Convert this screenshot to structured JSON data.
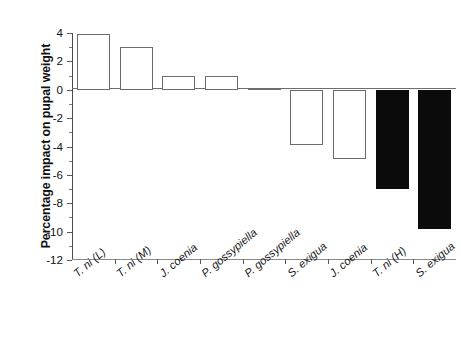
{
  "chart_data": {
    "type": "bar",
    "title": "",
    "xlabel": "",
    "ylabel": "Percentage impact on pupal weight",
    "categories": [
      "T. ni (L)",
      "T. ni (M)",
      "J. coenia",
      "P. gossypiella",
      "P. gossypiella",
      "S. exigua",
      "J. coenia",
      "T. ni (H)",
      "S. exigua"
    ],
    "values": [
      3.9,
      3.0,
      1.0,
      1.0,
      0.0,
      -3.9,
      -4.9,
      -7.0,
      -9.8
    ],
    "bar_styles": [
      "open",
      "open",
      "open",
      "open",
      "open",
      "open",
      "open",
      "filled",
      "filled"
    ],
    "ylim": [
      -12,
      4
    ],
    "yticks": [
      4,
      2,
      0,
      -2,
      -4,
      -6,
      -8,
      -10,
      -12
    ],
    "ytick_labels": [
      "4",
      "2",
      "0",
      "-2",
      "-4",
      "-6",
      "-8",
      "-10",
      "-12"
    ],
    "yminor_ticks": [
      3,
      1,
      -1,
      -3,
      -5,
      -7,
      -9,
      -11
    ],
    "grid": false,
    "legend": null,
    "colors": {
      "open_bar_fill": "#ffffff",
      "open_bar_edge": "#6b6b6b",
      "filled_bar": "#0b0b0b",
      "axis": "#5a5a5a",
      "text": "#111111",
      "background": "#ffffff"
    }
  }
}
